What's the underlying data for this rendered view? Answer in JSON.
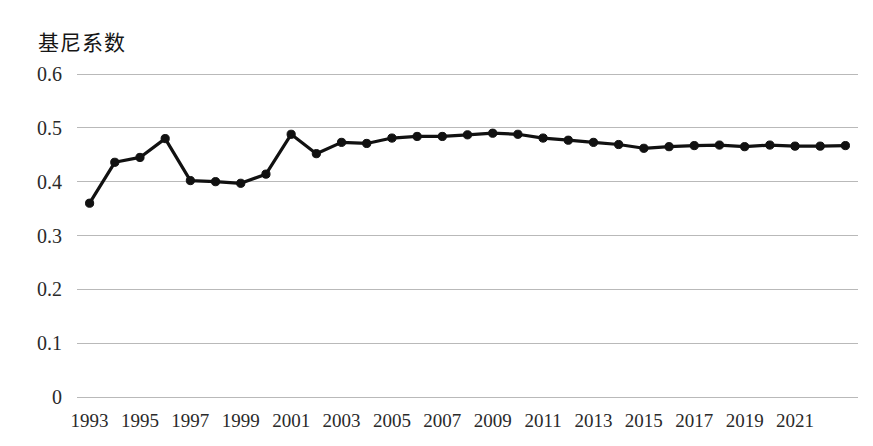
{
  "chart_data": {
    "type": "line",
    "title": "基尼系数",
    "ylabel": "基尼系数",
    "xlabel": "",
    "ylim": [
      0,
      0.6
    ],
    "yticks": [
      "0",
      "0.1",
      "0.2",
      "0.3",
      "0.4",
      "0.5",
      "0.6"
    ],
    "ytick_values": [
      0,
      0.1,
      0.2,
      0.3,
      0.4,
      0.5,
      0.6
    ],
    "xtick_labels": [
      "1993",
      "1995",
      "1997",
      "1999",
      "2001",
      "2003",
      "2005",
      "2007",
      "2009",
      "2011",
      "2013",
      "2015",
      "2017",
      "2019",
      "2021"
    ],
    "grid": true,
    "legend": "none",
    "x": [
      1993,
      1994,
      1995,
      1996,
      1997,
      1998,
      1999,
      2000,
      2001,
      2002,
      2003,
      2004,
      2005,
      2006,
      2007,
      2008,
      2009,
      2010,
      2011,
      2012,
      2013,
      2014,
      2015,
      2016,
      2017,
      2018,
      2019,
      2020,
      2021,
      2022,
      2023
    ],
    "values": [
      0.36,
      0.436,
      0.445,
      0.48,
      0.402,
      0.4,
      0.397,
      0.414,
      0.488,
      0.452,
      0.473,
      0.471,
      0.481,
      0.484,
      0.484,
      0.487,
      0.49,
      0.488,
      0.481,
      0.477,
      0.473,
      0.469,
      0.462,
      0.465,
      0.467,
      0.468,
      0.465,
      0.468,
      0.466,
      0.466,
      0.467
    ],
    "series_name": "基尼系数",
    "line_color": "#111111",
    "grid_color": "#b9b9b9"
  }
}
